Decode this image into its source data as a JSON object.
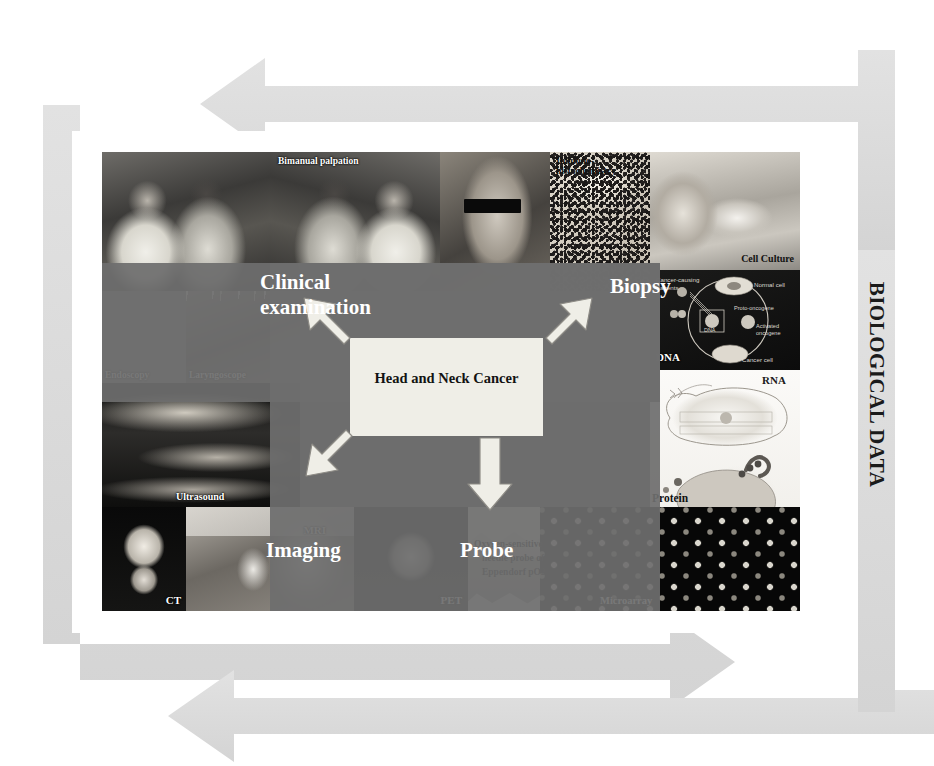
{
  "figure": {
    "center_label": "Head and Neck Cancer",
    "accent_gray": "#6e6e6e",
    "band_gray": "#dcdcdc"
  },
  "bands": {
    "left_label": "STAGING OF TUMORS",
    "right_label": "BIOLOGICAL DATA"
  },
  "quadrants": [
    {
      "key": "clinical",
      "label": "Clinical\nexamination",
      "line1": "Clinical",
      "line2": "examination"
    },
    {
      "key": "biopsy",
      "label": "Biopsy"
    },
    {
      "key": "imaging",
      "label": "Imaging"
    },
    {
      "key": "probe",
      "label": "Probe"
    }
  ],
  "arrows": {
    "inner": [
      {
        "name": "arrow-to-clinical",
        "direction": "up-left"
      },
      {
        "name": "arrow-to-biopsy",
        "direction": "up-right"
      },
      {
        "name": "arrow-to-imaging",
        "direction": "down-left"
      },
      {
        "name": "arrow-to-probe",
        "direction": "down"
      }
    ],
    "outer": [
      {
        "name": "outer-arrow-top",
        "direction": "left",
        "note": "biological data back to staging"
      },
      {
        "name": "outer-arrow-bottom",
        "direction": "right",
        "note": "staging forward to biological data"
      }
    ]
  },
  "panels": [
    {
      "key": "bimanual-palpation",
      "caption": "Bimanual palpation"
    },
    {
      "key": "immunohistochemistry",
      "caption_line1": "Immuno-",
      "caption_line2": "histochemistry"
    },
    {
      "key": "cell-culture",
      "caption": "Cell Culture"
    },
    {
      "key": "endoscopy",
      "caption": "Endoscopy"
    },
    {
      "key": "laryngoscope",
      "caption": "Laryngoscope"
    },
    {
      "key": "ultrasound",
      "caption": "Ultrasound"
    },
    {
      "key": "dna",
      "caption": "DNA"
    },
    {
      "key": "rna",
      "caption": "RNA"
    },
    {
      "key": "protein",
      "caption": "Protein"
    },
    {
      "key": "ct",
      "caption": "CT"
    },
    {
      "key": "mri",
      "caption": "MRI"
    },
    {
      "key": "pet",
      "caption": "PET"
    },
    {
      "key": "oxygen-probe",
      "caption_line1": "Oxygen-sensitive",
      "caption_line2": "needle probe of",
      "caption_line3": "Eppendorf pO2"
    },
    {
      "key": "microarray",
      "caption": "Microarray"
    }
  ],
  "dna_diagram": {
    "labels": [
      "Cancer-causing",
      "agents",
      "Normal cell",
      "Proto-oncogene",
      "Activated",
      "oncogene",
      "Cancer cell",
      "DNA"
    ]
  }
}
